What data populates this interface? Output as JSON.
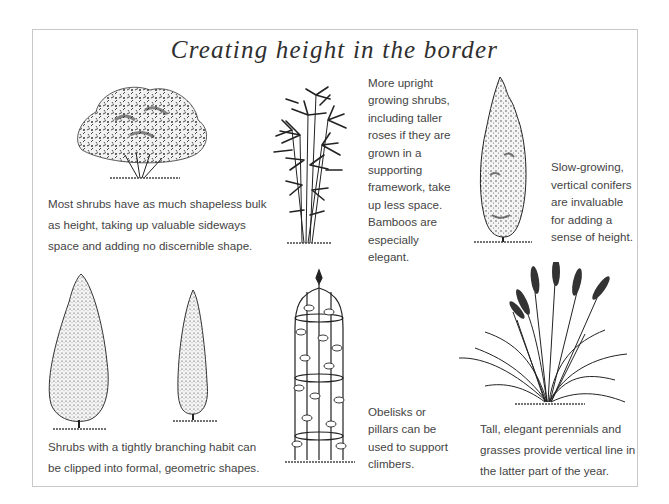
{
  "page": {
    "title": "Creating height in the border"
  },
  "panels": [
    {
      "id": "shapeless-shrub",
      "illustration": "rounded-shrub-icon",
      "caption_lines": [
        "Most shrubs have as much shapeless bulk",
        "as height, taking up valuable sideways",
        "space and adding no discernible shape."
      ]
    },
    {
      "id": "bamboo",
      "illustration": "bamboo-icon",
      "caption_lines": [
        "More upright",
        "growing shrubs,",
        "including taller",
        "roses if they are",
        "grown in a",
        "supporting",
        "framework, take",
        "up less space.",
        "Bamboos are",
        "especially elegant."
      ]
    },
    {
      "id": "conifer",
      "illustration": "conifer-icon",
      "caption_lines": [
        "Slow-growing,",
        "vertical conifers",
        "are invaluable",
        "for adding a",
        "sense of height."
      ]
    },
    {
      "id": "topiary",
      "illustration": "clipped-topiary-icon",
      "caption_lines": [
        "Shrubs with a tightly branching habit can",
        "be clipped into formal, geometric shapes."
      ]
    },
    {
      "id": "obelisk",
      "illustration": "obelisk-climber-icon",
      "caption_lines": [
        "Obelisks or",
        "pillars can be",
        "used to support",
        "climbers."
      ]
    },
    {
      "id": "grasses",
      "illustration": "ornamental-grass-icon",
      "caption_lines": [
        "Tall, elegant perennials and",
        "grasses provide vertical line in",
        "the latter part of the year."
      ]
    }
  ],
  "colors": {
    "frame": "#c9c9c9",
    "text": "#444444",
    "ink": "#222222"
  }
}
